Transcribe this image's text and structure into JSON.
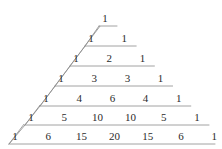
{
  "figure": {
    "background_color": "#ffffff",
    "text_color": "#2b2b2b",
    "line_color": "#8a8a8a",
    "line_width": 0.8
  },
  "chart_data": {
    "type": "table",
    "xlabel": "",
    "ylabel": "",
    "grid": false,
    "legend": null,
    "rows": [
      {
        "n": 0,
        "values": [
          1
        ]
      },
      {
        "n": 1,
        "values": [
          1,
          1
        ]
      },
      {
        "n": 2,
        "values": [
          1,
          2,
          1
        ]
      },
      {
        "n": 3,
        "values": [
          1,
          3,
          3,
          1
        ]
      },
      {
        "n": 4,
        "values": [
          1,
          4,
          6,
          4,
          1
        ]
      },
      {
        "n": 5,
        "values": [
          1,
          5,
          10,
          10,
          5,
          1
        ]
      },
      {
        "n": 6,
        "values": [
          1,
          6,
          15,
          20,
          15,
          6,
          1
        ]
      }
    ]
  },
  "layout": {
    "row_y": [
      18,
      38,
      58,
      78,
      98,
      117,
      136
    ],
    "row_start_x": [
      105,
      91,
      76,
      61,
      46,
      31,
      15
    ],
    "col_step": 33.2,
    "guide_lines": [
      {
        "row": 0,
        "x1": 99,
        "y1": 27,
        "x2": 121,
        "y2": 27,
        "diag_to_x": 99,
        "diag_to_y": 27
      },
      {
        "row": 1,
        "x1": 85,
        "y1": 47,
        "x2": 128,
        "y2": 47,
        "diag": true
      },
      {
        "row": 2,
        "x1": 70,
        "y1": 67,
        "x2": 161,
        "y2": 67,
        "diag": true
      },
      {
        "row": 3,
        "x1": 55,
        "y1": 87,
        "x2": 194,
        "y2": 87,
        "diag": true
      },
      {
        "row": 4,
        "x1": 40,
        "y1": 106,
        "x2": 194,
        "y2": 106,
        "diag": true
      },
      {
        "row": 5,
        "x1": 25,
        "y1": 126,
        "x2": 194,
        "y2": 126,
        "diag": true
      },
      {
        "row": 6,
        "x1": 10,
        "y1": 145,
        "x2": 194,
        "y2": 145,
        "diag": true
      }
    ]
  }
}
